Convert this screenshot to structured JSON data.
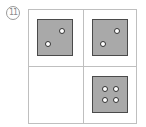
{
  "figure": {
    "label": "11",
    "grid": {
      "rows": 2,
      "cols": 2
    },
    "cells": [
      {
        "position": "top-left",
        "die_face": 2
      },
      {
        "position": "top-right",
        "die_face": 2
      },
      {
        "position": "bottom-left",
        "die_face": null
      },
      {
        "position": "bottom-right",
        "die_face": 4
      }
    ],
    "colors": {
      "die_fill": "#a9a9a9",
      "die_border": "#4a4a4a",
      "pip": "#ffffff",
      "grid_line": "#bfbfbf"
    }
  }
}
